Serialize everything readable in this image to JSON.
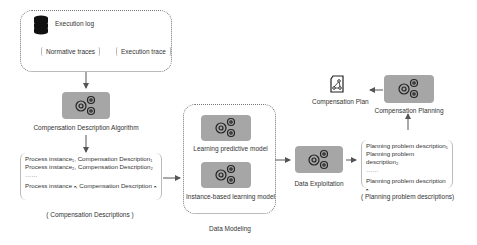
{
  "execution_log": {
    "title": "Execution log",
    "items": [
      "Normative traces",
      "Execution trace"
    ]
  },
  "compensation_description_algorithm": {
    "label": "Compensation Description Algorithm"
  },
  "compensation_descriptions": {
    "lines": [
      "Process instance₁, Compensation Description₁",
      "Process instance₂, Compensation Description₂",
      "……",
      "Process instance ₙ, Compensation Description ₙ"
    ],
    "caption": "( Compensation Descriptions )"
  },
  "data_modeling": {
    "models": [
      "Learning predictive model",
      "Instance-based learning model"
    ],
    "caption": "Data Modeling"
  },
  "data_exploitation": {
    "label": "Data Exploitation"
  },
  "planning_problem_descriptions": {
    "lines": [
      "Planning problem description₁",
      "Planning problem description₂",
      "……",
      "Planning problem description ₙ"
    ],
    "caption": "( Planning problem descriptions)"
  },
  "compensation_planning": {
    "label": "Compensation Planning"
  },
  "compensation_plan": {
    "label": "Compensation Plan"
  },
  "colors": {
    "gear_box": "#a6a6a6",
    "arrow": "#555555",
    "border": "#777777"
  }
}
